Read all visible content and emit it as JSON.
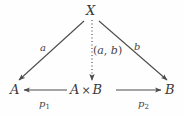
{
  "figure": {
    "kind": "commutative-diagram",
    "background_color": "#fefefe",
    "ink_color": "#4a4a4a"
  },
  "nodes": {
    "apex": {
      "label": "X",
      "x": 86,
      "y": 4
    },
    "left": {
      "label": "A",
      "x": 10,
      "y": 83
    },
    "center": {
      "object_left": "A",
      "operator": "×",
      "object_right": "B",
      "x": 70,
      "y": 83
    },
    "right": {
      "label": "B",
      "x": 165,
      "y": 83
    }
  },
  "edges": [
    {
      "name": "a",
      "label": "a",
      "from": "X",
      "to": "A",
      "style": "solid",
      "label_x": 40,
      "label_y": 43
    },
    {
      "name": "pair",
      "label": "(a, b)",
      "label_open": "(",
      "label_first": "a",
      "label_comma": ", ",
      "label_second": "b",
      "label_close": ")",
      "from": "X",
      "to": "A × B",
      "style": "dotted",
      "label_x": 93,
      "label_y": 45
    },
    {
      "name": "b",
      "label": "b",
      "from": "X",
      "to": "B",
      "style": "solid",
      "label_x": 134,
      "label_y": 42
    },
    {
      "name": "p1",
      "label_base": "p",
      "label_sub": "1",
      "from": "A × B",
      "to": "A",
      "style": "solid",
      "label_x": 39,
      "label_y": 99
    },
    {
      "name": "p2",
      "label_base": "p",
      "label_sub": "2",
      "from": "A × B",
      "to": "B",
      "style": "solid",
      "label_x": 138,
      "label_y": 99
    }
  ]
}
